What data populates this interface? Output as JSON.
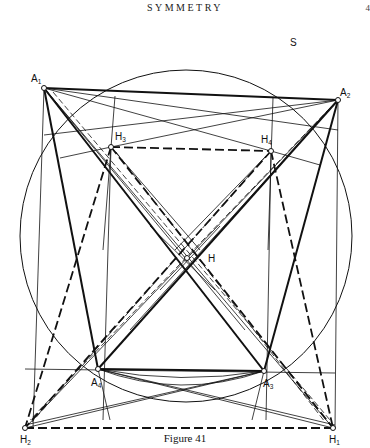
{
  "header": {
    "title": "SYMMETRY",
    "page_number": "4"
  },
  "caption": "Figure 41",
  "figure": {
    "circle_label": "S",
    "circle": {
      "cx": 186,
      "cy": 236,
      "r": 166
    },
    "points": {
      "A1": {
        "x": 44,
        "y": 88,
        "label": "A",
        "sub": "1"
      },
      "A2": {
        "x": 338,
        "y": 100,
        "label": "A",
        "sub": "2"
      },
      "A3": {
        "x": 264,
        "y": 371,
        "label": "A",
        "sub": "3"
      },
      "A4": {
        "x": 98,
        "y": 369,
        "label": "A",
        "sub": "4"
      },
      "H1": {
        "x": 333,
        "y": 428,
        "label": "H",
        "sub": "1"
      },
      "H2": {
        "x": 25,
        "y": 428,
        "label": "H",
        "sub": "2"
      },
      "H3": {
        "x": 111,
        "y": 147,
        "label": "H",
        "sub": "3"
      },
      "H4": {
        "x": 271,
        "y": 151,
        "label": "H",
        "sub": "4"
      },
      "H": {
        "x": 187,
        "y": 258,
        "label": "H",
        "sub": ""
      }
    }
  }
}
